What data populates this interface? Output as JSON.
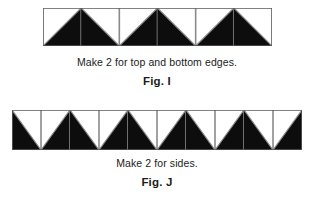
{
  "document": {
    "title": "Quilt Border Strip Piecing Diagram",
    "background_color": "#ffffff"
  },
  "palette": {
    "triangle_dark": "#0d0d0d",
    "triangle_light": "#ffffff",
    "block_outline": "#8a8a8a",
    "strip_outline": "#5a5a5a",
    "text_color": "#1b1b1b"
  },
  "figures": [
    {
      "id": "fig-i",
      "label": "Fig. I",
      "note": "Make 2 for top and bottom edges.",
      "strip": {
        "name": "top-and-bottom-edge-strip",
        "square_count": 6,
        "unit_count": 3,
        "unit_description": "half-square-triangle pair forming an upward peak",
        "squares": [
          {
            "index": 0,
            "type": "hst-dark-lower-right",
            "peak": "rising"
          },
          {
            "index": 1,
            "type": "hst-dark-lower-left",
            "peak": "falling"
          },
          {
            "index": 2,
            "type": "hst-dark-lower-right",
            "peak": "rising"
          },
          {
            "index": 3,
            "type": "hst-dark-lower-left",
            "peak": "falling"
          },
          {
            "index": 4,
            "type": "hst-dark-lower-right",
            "peak": "rising"
          },
          {
            "index": 5,
            "type": "hst-dark-lower-left",
            "peak": "falling"
          }
        ]
      }
    },
    {
      "id": "fig-j",
      "label": "Fig. J",
      "note": "Make 2 for sides.",
      "strip": {
        "name": "side-edge-strip",
        "square_count": 10,
        "unit_count": 5,
        "unit_description": "half-square-triangle pairs; strip begins with a falling half and ends with a rising half",
        "squares": [
          {
            "index": 0,
            "type": "hst-dark-lower-left",
            "peak": "falling"
          },
          {
            "index": 1,
            "type": "hst-dark-lower-right",
            "peak": "rising"
          },
          {
            "index": 2,
            "type": "hst-dark-lower-left",
            "peak": "falling"
          },
          {
            "index": 3,
            "type": "hst-dark-lower-right",
            "peak": "rising"
          },
          {
            "index": 4,
            "type": "hst-dark-lower-left",
            "peak": "falling"
          },
          {
            "index": 5,
            "type": "hst-dark-lower-right",
            "peak": "rising"
          },
          {
            "index": 6,
            "type": "hst-dark-lower-left",
            "peak": "falling"
          },
          {
            "index": 7,
            "type": "hst-dark-lower-right",
            "peak": "rising"
          },
          {
            "index": 8,
            "type": "hst-dark-lower-left",
            "peak": "falling"
          },
          {
            "index": 9,
            "type": "hst-dark-lower-right",
            "peak": "rising"
          }
        ]
      }
    }
  ]
}
